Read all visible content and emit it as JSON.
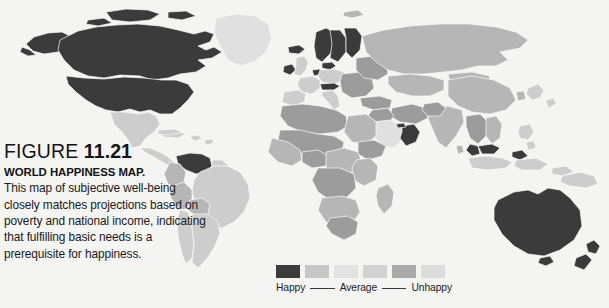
{
  "figure": {
    "label": "FIGURE",
    "number": "11.21",
    "title": "WORLD HAPPINESS MAP.",
    "body": "This map of subjective well-being closely matches projections based on poverty and national income, indicating that fulfilling basic needs is a prerequisite for happiness."
  },
  "legend": {
    "happy_label": "Happy",
    "average_label": "Average",
    "unhappy_label": "Unhappy",
    "swatch_colors": [
      "#3b3b3b",
      "#c6c6c6",
      "#e2e2e2",
      "#d2d2d2",
      "#a9a9a9",
      "#dcdcdc"
    ]
  },
  "map": {
    "name": "world-happiness-choropleth",
    "ocean_color": "#f4f4f3",
    "border_color": "#fbfbfb",
    "scale": {
      "happiest": "#3b3b3b",
      "happy": "#6f6f6f",
      "above_average": "#9c9c9c",
      "average": "#b6b6b6",
      "below_average": "#cdcdcd",
      "unhappy": "#e0e0e0"
    },
    "regions": [
      {
        "name": "Canada",
        "level": "happiest"
      },
      {
        "name": "United States",
        "level": "happiest"
      },
      {
        "name": "Alaska",
        "level": "happiest"
      },
      {
        "name": "Greenland",
        "level": "unhappy"
      },
      {
        "name": "Iceland",
        "level": "happiest"
      },
      {
        "name": "Mexico",
        "level": "below_average"
      },
      {
        "name": "Central America",
        "level": "below_average"
      },
      {
        "name": "Caribbean",
        "level": "below_average"
      },
      {
        "name": "Venezuela",
        "level": "happiest"
      },
      {
        "name": "Colombia",
        "level": "average"
      },
      {
        "name": "Brazil",
        "level": "below_average"
      },
      {
        "name": "Peru",
        "level": "average"
      },
      {
        "name": "Bolivia",
        "level": "average"
      },
      {
        "name": "Chile",
        "level": "below_average"
      },
      {
        "name": "Argentina",
        "level": "below_average"
      },
      {
        "name": "Norway",
        "level": "happiest"
      },
      {
        "name": "Sweden",
        "level": "happiest"
      },
      {
        "name": "Finland",
        "level": "happiest"
      },
      {
        "name": "Denmark",
        "level": "happiest"
      },
      {
        "name": "Ireland",
        "level": "happiest"
      },
      {
        "name": "United Kingdom",
        "level": "below_average"
      },
      {
        "name": "Netherlands",
        "level": "happiest"
      },
      {
        "name": "Switzerland",
        "level": "happiest"
      },
      {
        "name": "Austria",
        "level": "happiest"
      },
      {
        "name": "Western Europe",
        "level": "below_average"
      },
      {
        "name": "Eastern Europe",
        "level": "average"
      },
      {
        "name": "Russia",
        "level": "average"
      },
      {
        "name": "North Africa",
        "level": "average"
      },
      {
        "name": "Sub-Saharan Africa",
        "level": "average"
      },
      {
        "name": "Oman",
        "level": "happiest"
      },
      {
        "name": "Saudi Arabia",
        "level": "unhappy"
      },
      {
        "name": "India",
        "level": "average"
      },
      {
        "name": "China",
        "level": "below_average"
      },
      {
        "name": "Mongolia",
        "level": "average"
      },
      {
        "name": "Japan",
        "level": "below_average"
      },
      {
        "name": "Malaysia",
        "level": "happiest"
      },
      {
        "name": "Brunei",
        "level": "happiest"
      },
      {
        "name": "Indonesia",
        "level": "below_average"
      },
      {
        "name": "Philippines",
        "level": "below_average"
      },
      {
        "name": "Papua New Guinea",
        "level": "below_average"
      },
      {
        "name": "Australia",
        "level": "happiest"
      },
      {
        "name": "New Zealand",
        "level": "happiest"
      }
    ]
  }
}
